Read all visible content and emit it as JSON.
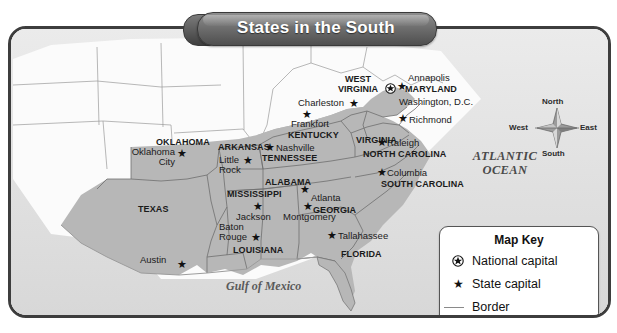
{
  "title": "States in the South",
  "colors": {
    "south_fill": "#b7b7b7",
    "other_state_fill": "#fbfbfb",
    "water": "#e3e3e3",
    "border": "#8a8a8a",
    "frame": "#3d3d3d",
    "banner_dark": "#4f4f4f",
    "banner_text": "#ffffff"
  },
  "water_labels": [
    {
      "name": "atlantic-ocean",
      "line1": "ATLANTIC",
      "line2": "OCEAN"
    },
    {
      "name": "gulf-of-mexico",
      "text": "Gulf of Mexico"
    }
  ],
  "compass": {
    "north": "North",
    "south": "South",
    "east": "East",
    "west": "West"
  },
  "map_key": {
    "heading": "Map Key",
    "items": [
      {
        "icon": "national-capital-star-icon",
        "label": "National capital"
      },
      {
        "icon": "state-capital-star-icon",
        "label": "State capital"
      },
      {
        "icon": "border-line-icon",
        "label": "Border"
      }
    ]
  },
  "states": [
    {
      "name": "OKLAHOMA"
    },
    {
      "name": "TEXAS"
    },
    {
      "name": "ARKANSAS"
    },
    {
      "name": "LOUISIANA"
    },
    {
      "name": "MISSISSIPPI"
    },
    {
      "name": "ALABAMA"
    },
    {
      "name": "TENNESSEE"
    },
    {
      "name": "KENTUCKY"
    },
    {
      "name": "WEST VIRGINIA",
      "line1": "WEST",
      "line2": "VIRGINIA"
    },
    {
      "name": "VIRGINIA"
    },
    {
      "name": "MARYLAND"
    },
    {
      "name": "NORTH CAROLINA"
    },
    {
      "name": "SOUTH CAROLINA"
    },
    {
      "name": "GEORGIA"
    },
    {
      "name": "FLORIDA"
    }
  ],
  "cities": [
    {
      "name": "Oklahoma City",
      "line1": "Oklahoma",
      "line2": "City",
      "type": "state capital"
    },
    {
      "name": "Austin",
      "type": "state capital"
    },
    {
      "name": "Little Rock",
      "line1": "Little",
      "line2": "Rock",
      "type": "state capital"
    },
    {
      "name": "Baton Rouge",
      "line1": "Baton",
      "line2": "Rouge",
      "type": "state capital"
    },
    {
      "name": "Jackson",
      "type": "state capital"
    },
    {
      "name": "Montgomery",
      "type": "state capital"
    },
    {
      "name": "Nashville",
      "type": "state capital"
    },
    {
      "name": "Frankfort",
      "type": "state capital"
    },
    {
      "name": "Charleston",
      "type": "state capital"
    },
    {
      "name": "Richmond",
      "type": "state capital"
    },
    {
      "name": "Annapolis",
      "type": "state capital"
    },
    {
      "name": "Raleigh",
      "type": "state capital"
    },
    {
      "name": "Columbia",
      "type": "state capital"
    },
    {
      "name": "Atlanta",
      "type": "state capital"
    },
    {
      "name": "Tallahassee",
      "type": "state capital"
    },
    {
      "name": "Washington, D.C.",
      "type": "national capital"
    }
  ]
}
